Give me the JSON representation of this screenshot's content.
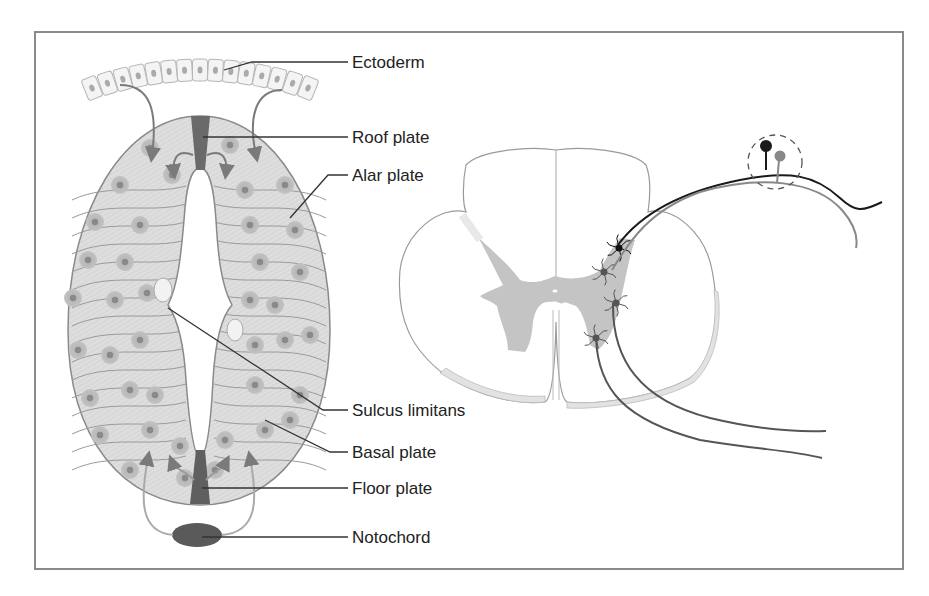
{
  "figure": {
    "left_panel": "Neural tube cross-section (embryonic development)",
    "right_panel": "Adult spinal cord cross-section with dorsal root ganglion",
    "labels": [
      {
        "id": "ectoderm",
        "text": "Ectoderm"
      },
      {
        "id": "roof-plate",
        "text": "Roof plate"
      },
      {
        "id": "alar-plate",
        "text": "Alar plate"
      },
      {
        "id": "sulcus-limitans",
        "text": "Sulcus limitans"
      },
      {
        "id": "basal-plate",
        "text": "Basal plate"
      },
      {
        "id": "floor-plate",
        "text": "Floor plate"
      },
      {
        "id": "notochord",
        "text": "Notochord"
      }
    ]
  },
  "colors": {
    "neural_tube_fill": "#d6d6d6",
    "roof_floor_plate": "#666666",
    "notochord": "#5a5a5a",
    "grey_matter": "#c4c4c4",
    "outline": "#8c8c8c",
    "leader_line": "#333333",
    "sensory_fiber_dark": "#1a1a1a",
    "sensory_fiber_light": "#888888",
    "motor_fiber": "#555555"
  }
}
